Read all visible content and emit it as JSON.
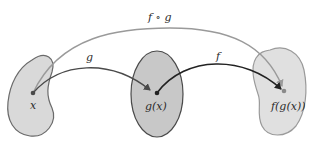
{
  "diagram": {
    "sets": [
      {
        "id": "domain-g",
        "point_label": "x",
        "fill": "#d9d9d9",
        "stroke": "#6a6a6a"
      },
      {
        "id": "range-g",
        "point_label": "g(x)",
        "fill": "#c8c8c8",
        "stroke": "#4a4a4a"
      },
      {
        "id": "range-f",
        "point_label": "f(g(x))",
        "fill": "#e0e0e0",
        "stroke": "#9a9a9a"
      }
    ],
    "arrows": [
      {
        "id": "g",
        "label": "g",
        "from": "x",
        "to": "g(x)",
        "color": "#4a4a4a"
      },
      {
        "id": "f",
        "label": "f",
        "from": "g(x)",
        "to": "f(g(x))",
        "color": "#222222"
      },
      {
        "id": "fog",
        "label": "f ∘ g",
        "from": "x",
        "to": "f(g(x))",
        "color": "#9a9a9a"
      }
    ]
  }
}
